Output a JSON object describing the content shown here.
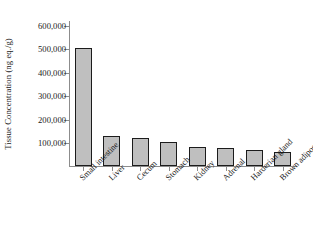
{
  "chart_data": {
    "type": "bar",
    "title": "",
    "xlabel": "",
    "ylabel": "Tissue Concentration (ng eq./g)",
    "categories": [
      "Small intestine",
      "Liver",
      "Cecum",
      "Stomach",
      "Kidney",
      "Adrenal",
      "Harderian gland",
      "Brown adipose"
    ],
    "values": [
      500000,
      128000,
      120000,
      103000,
      80000,
      75000,
      68000,
      58000
    ],
    "ylim": [
      0,
      620000
    ],
    "ytick_values": [
      100000,
      200000,
      300000,
      400000,
      500000,
      600000
    ],
    "ytick_labels": [
      "100,000",
      "200,000",
      "300,000",
      "400,000",
      "500,000",
      "600,000"
    ],
    "grid": false,
    "legend": null,
    "bar_fill_color": "#bfbfbf",
    "bar_edge_color": "#1c1c1c",
    "axis_color": "#8c8c8c",
    "text_color": "#1a1a1a",
    "background_color": "#ffffff",
    "xtick_label_rotation": -45
  }
}
